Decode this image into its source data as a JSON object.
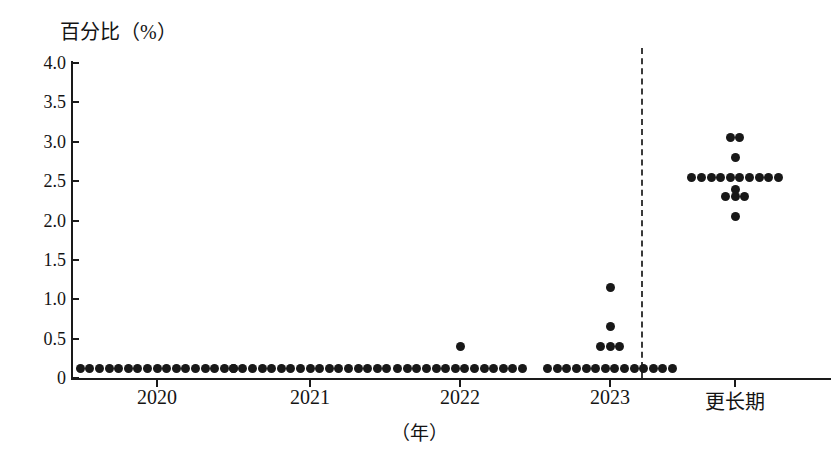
{
  "chart_data": {
    "type": "scatter",
    "subtype": "dot-plot",
    "title": "",
    "ylabel": "百分比（%）",
    "xlabel": "（年）",
    "ylim": [
      0,
      4.0
    ],
    "ytick_labels": [
      "0",
      "0.5",
      "1.0",
      "1.5",
      "2.0",
      "2.5",
      "3.0",
      "3.5",
      "4.0"
    ],
    "ytick_values": [
      0,
      0.5,
      1.0,
      1.5,
      2.0,
      2.5,
      3.0,
      3.5,
      4.0
    ],
    "grid": false,
    "legend": null,
    "categories": [
      "2020",
      "2021",
      "2022",
      "2023",
      "更长期"
    ],
    "separator_after_category": "2023",
    "series": [
      {
        "name": "2020",
        "points": [
          {
            "value": 0.125,
            "count": 17
          }
        ]
      },
      {
        "name": "2021",
        "points": [
          {
            "value": 0.125,
            "count": 17
          }
        ]
      },
      {
        "name": "2022",
        "points": [
          {
            "value": 0.125,
            "count": 14
          },
          {
            "value": 0.4,
            "count": 1
          }
        ]
      },
      {
        "name": "2023",
        "points": [
          {
            "value": 0.125,
            "count": 14
          },
          {
            "value": 0.4,
            "count": 3
          },
          {
            "value": 0.65,
            "count": 1
          },
          {
            "value": 1.15,
            "count": 1
          }
        ]
      },
      {
        "name": "更长期",
        "points": [
          {
            "value": 2.05,
            "count": 1
          },
          {
            "value": 2.3,
            "count": 3
          },
          {
            "value": 2.4,
            "count": 1
          },
          {
            "value": 2.55,
            "count": 10
          },
          {
            "value": 2.8,
            "count": 1
          },
          {
            "value": 3.05,
            "count": 2
          }
        ]
      }
    ]
  },
  "axes": {
    "y_title": "百分比（%）",
    "x_unit": "（年）",
    "x_labels": [
      {
        "label": "2020"
      },
      {
        "label": "2021"
      },
      {
        "label": "2022"
      },
      {
        "label": "2023"
      },
      {
        "label": "更长期"
      }
    ],
    "y_labels": [
      {
        "label": "4.0"
      },
      {
        "label": "3.5"
      },
      {
        "label": "3.0"
      },
      {
        "label": "2.5"
      },
      {
        "label": "2.0"
      },
      {
        "label": "1.5"
      },
      {
        "label": "1.0"
      },
      {
        "label": "0.5"
      },
      {
        "label": "0"
      }
    ]
  },
  "colors": {
    "dot": "#181818",
    "axis": "#1a1a1a",
    "separator": "#3a3a3a",
    "background": "#ffffff"
  }
}
